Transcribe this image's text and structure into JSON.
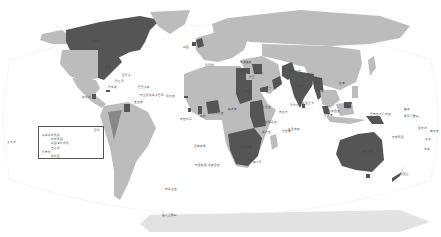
{
  "map": {
    "type": "world-political-highlight",
    "colors": {
      "ocean": "#ffffff",
      "land": "#bcbcbc",
      "highlight": "#555555",
      "outline_grid": "#e6e6e6",
      "antarctica": "#d9d9d9"
    },
    "highlighted_regions": [
      "Canada",
      "United States (east)",
      "United Kingdom",
      "Guyana",
      "Jamaica",
      "Belize",
      "Trinidad and Tobago",
      "Nigeria",
      "Ghana",
      "Sierra Leone",
      "Gambia",
      "Cameroon",
      "Egypt",
      "Sudan",
      "Kenya",
      "Uganda",
      "Tanzania",
      "Zambia",
      "Malawi",
      "Mozambique",
      "Zimbabwe",
      "Botswana",
      "Namibia",
      "South Africa",
      "Lesotho",
      "Eswatini",
      "Iraq",
      "Jordan",
      "Yemen (Aden)",
      "Oman",
      "India",
      "Pakistan",
      "Bangladesh",
      "Sri Lanka",
      "Myanmar",
      "Malaysia",
      "Singapore",
      "Brunei",
      "Papua New Guinea",
      "Australia",
      "New Zealand",
      "Fiji",
      "Cyprus",
      "Malta"
    ],
    "side_label": "太平洋",
    "legend": {
      "title": "图例",
      "rows": [
        "英联邦成员国",
        "前成员国",
        "英国海外领地",
        "自治领",
        "托管地",
        "保护国"
      ]
    },
    "labels": [
      {
        "text": "加拿大",
        "x": 92,
        "y": 42
      },
      {
        "text": "美国",
        "x": 105,
        "y": 68
      },
      {
        "text": "百慕大",
        "x": 122,
        "y": 76
      },
      {
        "text": "巴哈马",
        "x": 115,
        "y": 82
      },
      {
        "text": "牙买加",
        "x": 108,
        "y": 88
      },
      {
        "text": "伯利兹",
        "x": 82,
        "y": 98
      },
      {
        "text": "巴巴多斯",
        "x": 138,
        "y": 88
      },
      {
        "text": "特立尼达和多巴哥",
        "x": 140,
        "y": 96
      },
      {
        "text": "圭亚那",
        "x": 134,
        "y": 103
      },
      {
        "text": "英国",
        "x": 183,
        "y": 48
      },
      {
        "text": "马耳他",
        "x": 205,
        "y": 66
      },
      {
        "text": "塞浦路斯",
        "x": 240,
        "y": 63
      },
      {
        "text": "冈比亚",
        "x": 166,
        "y": 97
      },
      {
        "text": "塞拉利昂",
        "x": 180,
        "y": 120
      },
      {
        "text": "加纳",
        "x": 200,
        "y": 117
      },
      {
        "text": "尼日利亚",
        "x": 212,
        "y": 114
      },
      {
        "text": "喀麦隆",
        "x": 228,
        "y": 110
      },
      {
        "text": "埃及",
        "x": 241,
        "y": 72
      },
      {
        "text": "苏丹",
        "x": 244,
        "y": 92
      },
      {
        "text": "肯尼亚",
        "x": 262,
        "y": 108
      },
      {
        "text": "坦桑尼亚",
        "x": 265,
        "y": 123
      },
      {
        "text": "赞比亚",
        "x": 262,
        "y": 133
      },
      {
        "text": "马拉维",
        "x": 282,
        "y": 132
      },
      {
        "text": "毛里求斯",
        "x": 288,
        "y": 130
      },
      {
        "text": "塞舌尔",
        "x": 279,
        "y": 113
      },
      {
        "text": "博茨瓦纳",
        "x": 240,
        "y": 148
      },
      {
        "text": "南非",
        "x": 247,
        "y": 161
      },
      {
        "text": "莱索托",
        "x": 253,
        "y": 163
      },
      {
        "text": "圣赫勒拿",
        "x": 194,
        "y": 147
      },
      {
        "text": "特里斯坦-达库尼亚",
        "x": 195,
        "y": 166
      },
      {
        "text": "南乔治亚",
        "x": 165,
        "y": 190
      },
      {
        "text": "福克兰群岛",
        "x": 162,
        "y": 216
      },
      {
        "text": "伊拉克",
        "x": 255,
        "y": 74
      },
      {
        "text": "约旦",
        "x": 249,
        "y": 78
      },
      {
        "text": "亚丁",
        "x": 266,
        "y": 89
      },
      {
        "text": "阿曼",
        "x": 275,
        "y": 84
      },
      {
        "text": "巴基斯坦",
        "x": 289,
        "y": 72
      },
      {
        "text": "印度",
        "x": 297,
        "y": 87
      },
      {
        "text": "孟加拉",
        "x": 311,
        "y": 84
      },
      {
        "text": "缅甸",
        "x": 318,
        "y": 92
      },
      {
        "text": "斯里兰卡",
        "x": 302,
        "y": 104
      },
      {
        "text": "马尔代夫",
        "x": 290,
        "y": 106
      },
      {
        "text": "香港",
        "x": 339,
        "y": 84
      },
      {
        "text": "马来西亚",
        "x": 328,
        "y": 112
      },
      {
        "text": "新加坡",
        "x": 324,
        "y": 116
      },
      {
        "text": "文莱",
        "x": 346,
        "y": 108
      },
      {
        "text": "巴布亚新几内亚",
        "x": 370,
        "y": 115
      },
      {
        "text": "所罗门群岛",
        "x": 404,
        "y": 117
      },
      {
        "text": "瑙鲁",
        "x": 404,
        "y": 110
      },
      {
        "text": "图瓦卢",
        "x": 418,
        "y": 129
      },
      {
        "text": "斐济",
        "x": 425,
        "y": 140
      },
      {
        "text": "瓦努阿图",
        "x": 392,
        "y": 138
      },
      {
        "text": "汤加",
        "x": 424,
        "y": 150
      },
      {
        "text": "萨摩亚",
        "x": 430,
        "y": 132
      },
      {
        "text": "澳大利亚",
        "x": 362,
        "y": 152
      },
      {
        "text": "新西兰",
        "x": 400,
        "y": 175
      }
    ]
  }
}
